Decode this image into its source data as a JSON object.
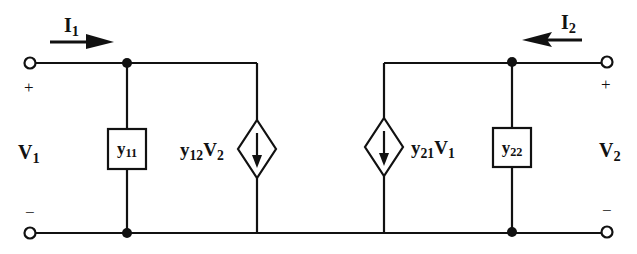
{
  "diagram": {
    "type": "two-port y-parameter equivalent circuit",
    "currents": {
      "input": {
        "symbol": "I",
        "sub": "1",
        "direction": "right"
      },
      "output": {
        "symbol": "I",
        "sub": "2",
        "direction": "left"
      }
    },
    "voltages": {
      "input": {
        "symbol": "V",
        "sub": "1",
        "plus": "+",
        "minus": "−"
      },
      "output": {
        "symbol": "V",
        "sub": "2",
        "plus": "+",
        "minus": "−"
      }
    },
    "admittances": {
      "y11": {
        "symbol": "y",
        "sub": "11"
      },
      "y22": {
        "symbol": "y",
        "sub": "22"
      }
    },
    "sources": {
      "source1": {
        "coef": "y",
        "coef_sub": "12",
        "var": "V",
        "var_sub": "2",
        "direction": "down"
      },
      "source2": {
        "coef": "y",
        "coef_sub": "21",
        "var": "V",
        "var_sub": "1",
        "direction": "down"
      }
    },
    "stroke_color": "#111111"
  }
}
